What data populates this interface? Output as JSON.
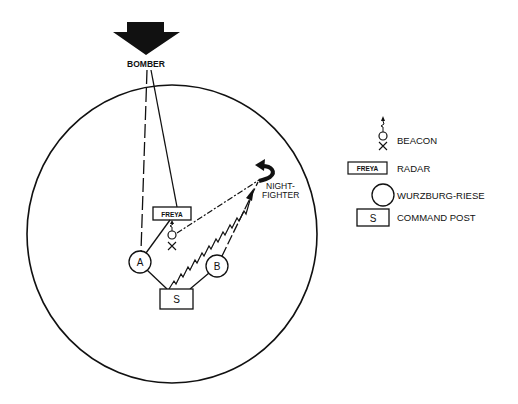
{
  "diagram": {
    "colors": {
      "ink": "#111111",
      "background": "#ffffff"
    },
    "nodes": {
      "bomber": {
        "label": "BOMBER",
        "icon": "bomber-arrow-icon"
      },
      "night_fighter": {
        "label_line1": "NIGHT-",
        "label_line2": "FIGHTER",
        "icon": "night-fighter-hook-arrow-icon"
      },
      "freya": {
        "label": "FREYA",
        "type": "radar"
      },
      "wurzburg_a": {
        "label": "A",
        "type": "wurzburg-riese"
      },
      "wurzburg_b": {
        "label": "B",
        "type": "wurzburg-riese"
      },
      "command_post": {
        "label": "S",
        "type": "command-post"
      },
      "beacon": {
        "type": "beacon"
      }
    },
    "connections": [
      {
        "from": "bomber",
        "to": "wurzburg_a",
        "style": "long-dash"
      },
      {
        "from": "bomber",
        "to": "freya",
        "style": "solid"
      },
      {
        "from": "freya",
        "to": "wurzburg_a",
        "style": "solid"
      },
      {
        "from": "wurzburg_a",
        "to": "command_post",
        "style": "solid"
      },
      {
        "from": "wurzburg_b",
        "to": "command_post",
        "style": "solid"
      },
      {
        "from": "wurzburg_b",
        "to": "night_fighter",
        "style": "long-dash"
      },
      {
        "from": "beacon",
        "to": "night_fighter",
        "style": "dash-dot"
      },
      {
        "from": "command_post",
        "to": "night_fighter",
        "style": "zigzag-radio"
      }
    ],
    "legend": {
      "items": [
        {
          "icon": "beacon-icon",
          "label": "BEACON"
        },
        {
          "icon": "freya-radar-icon",
          "icon_text": "FREYA",
          "label": "RADAR"
        },
        {
          "icon": "wurzburg-riese-icon",
          "label": "WURZBURG-RIESE"
        },
        {
          "icon": "command-post-icon",
          "icon_text": "S",
          "label": "COMMAND POST"
        }
      ]
    }
  }
}
